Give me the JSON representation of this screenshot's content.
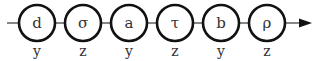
{
  "diagram": {
    "type": "sequence-chain",
    "direction": "left-to-right",
    "colors": {
      "stroke": "#111111",
      "text": "#333333",
      "background": "#ffffff"
    },
    "nodes": [
      {
        "symbol": "d",
        "label": "y"
      },
      {
        "symbol": "σ",
        "label": "z"
      },
      {
        "symbol": "a",
        "label": "y"
      },
      {
        "symbol": "τ",
        "label": "z"
      },
      {
        "symbol": "b",
        "label": "y"
      },
      {
        "symbol": "ρ",
        "label": "z"
      }
    ],
    "end_marker": "arrow-right"
  }
}
